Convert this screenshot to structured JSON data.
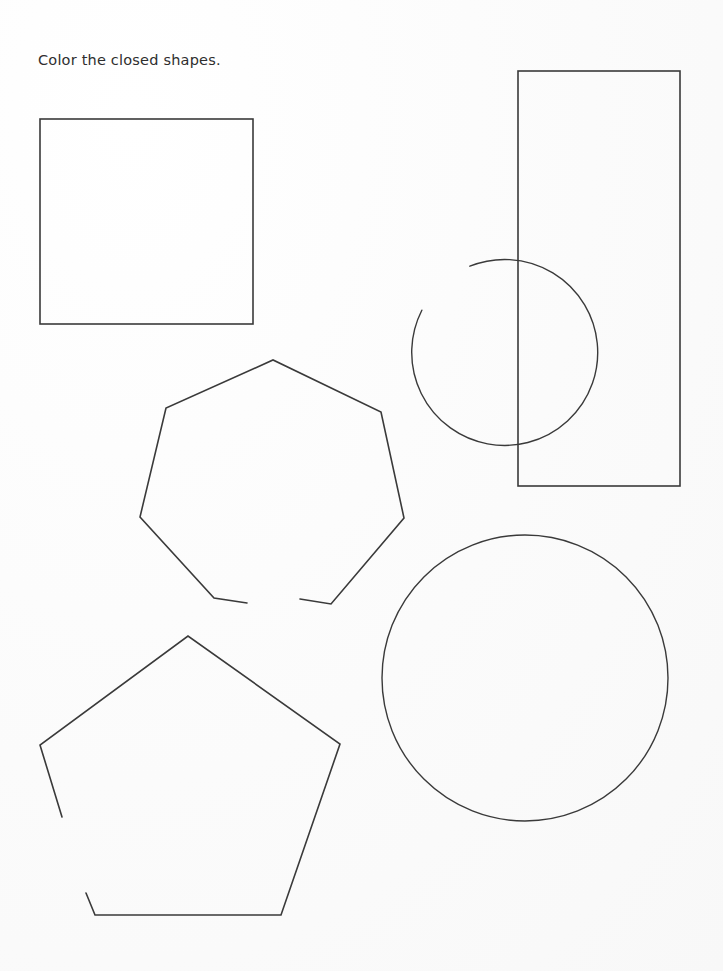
{
  "page": {
    "title": "Color the closed shapes.",
    "width": 723,
    "height": 971,
    "background_color": "#fbfbfb",
    "stroke_color": "#3a3a3a",
    "worksheet_type": "closed-vs-open-shapes"
  },
  "instruction": {
    "text": "Color the closed shapes."
  },
  "shapes": [
    {
      "id": "square",
      "label": "square",
      "closed": true,
      "geometry": "rect",
      "x": 40,
      "y": 119,
      "width": 213,
      "height": 205
    },
    {
      "id": "open-circle",
      "label": "open circle with gap",
      "closed": false,
      "geometry": "arc",
      "cx": 387,
      "cy": 224,
      "r": 93,
      "gap_start_deg": 27,
      "gap_end_deg": 68
    },
    {
      "id": "tall-rectangle",
      "label": "tall rectangle",
      "closed": true,
      "geometry": "rect",
      "x": 518,
      "y": 71,
      "width": 162,
      "height": 415
    },
    {
      "id": "open-heptagon",
      "label": "open heptagon with bottom gap",
      "closed": false,
      "geometry": "polyline",
      "points": "247,603 214,598 140,517 166,408 273,360 381,412 404,518 331,604 300,599",
      "gap_location": "bottom-center"
    },
    {
      "id": "large-circle",
      "label": "large circle",
      "closed": true,
      "geometry": "circle",
      "cx": 525,
      "cy": 678,
      "r": 143
    },
    {
      "id": "open-pentagon",
      "label": "open pentagon with left gap",
      "closed": false,
      "geometry": "polyline",
      "points": "62,817 40,745 188,636 340,744 281,915 95,915 86,893",
      "gap_location": "lower-left"
    }
  ],
  "counts": {
    "total_shapes": 6,
    "closed_shapes": 3,
    "open_shapes": 3
  }
}
